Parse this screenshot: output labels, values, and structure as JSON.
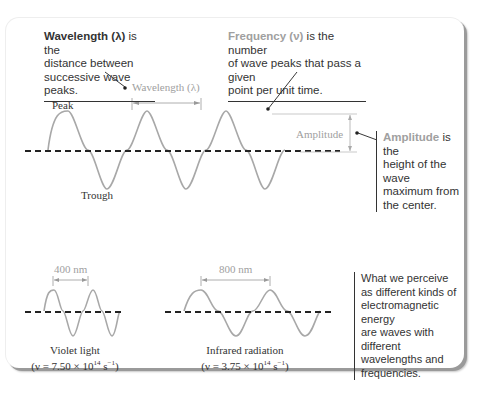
{
  "notes": {
    "wavelength": {
      "term": "Wavelength (λ)",
      "rest_line1": " is the",
      "line2": "distance between",
      "line3": "successive wave peaks."
    },
    "frequency": {
      "term": "Frequency (ν)",
      "rest_line1": " is the number",
      "line2": "of wave peaks that pass a given",
      "line3": "point per unit time."
    },
    "amplitude": {
      "term": "Amplitude",
      "rest_line1": " is the",
      "line2": "height of the wave",
      "line3": "maximum from",
      "line4": "the center."
    },
    "perceive": {
      "line1": "What we perceive",
      "line2": "as different kinds of",
      "line3": "electromagnetic energy",
      "line4": "are waves with different",
      "line5": "wavelengths and",
      "line6": "frequencies."
    }
  },
  "labels": {
    "wavelength_marker": "Wavelength (λ)",
    "peak": "Peak",
    "trough": "Trough",
    "amplitude_marker": "Amplitude",
    "violet_wavelength": "400 nm",
    "infrared_wavelength": "800 nm"
  },
  "examples": {
    "violet": {
      "name": "Violet light",
      "freq_prefix": "(ν = 7.50 × 10",
      "exp": "14",
      "unit": " s",
      "unit_exp": "−1",
      "close": ")"
    },
    "infrared": {
      "name": "Infrared radiation",
      "freq_prefix": "(ν = 3.75 × 10",
      "exp": "14",
      "unit": " s",
      "unit_exp": "−1",
      "close": ")"
    }
  },
  "colors": {
    "wave": "#a8a8a8",
    "accent_text": "#a0a0a0",
    "text": "#333333",
    "axis": "#222222"
  }
}
